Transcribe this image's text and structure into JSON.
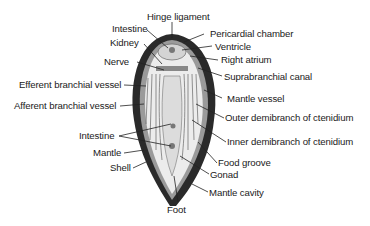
{
  "colors": {
    "shell": "#2a2a2a",
    "mantle": "#9a9a9a",
    "tissue": "#e6e6e6",
    "lines": "#222222",
    "text": "#1a1a1a"
  },
  "labels": {
    "hinge_ligament": "Hinge ligament",
    "pericardial_chamber": "Pericardial chamber",
    "intestine_top": "Intestine",
    "ventricle": "Ventricle",
    "kidney": "Kidney",
    "right_atrium": "Right atrium",
    "nerve": "Nerve",
    "suprabranchial_canal": "Suprabranchial canal",
    "efferent_branchial_vessel": "Efferent branchial vessel",
    "mantle_vessel": "Mantle vessel",
    "afferent_branchial_vessel": "Afferent branchial vessel",
    "outer_demibranch": "Outer demibranch of ctenidium",
    "inner_demibranch": "Inner demibranch of ctenidium",
    "intestine_bottom": "Intestine",
    "food_groove": "Food groove",
    "mantle": "Mantle",
    "gonad": "Gonad",
    "shell": "Shell",
    "mantle_cavity": "Mantle cavity",
    "foot": "Foot"
  }
}
